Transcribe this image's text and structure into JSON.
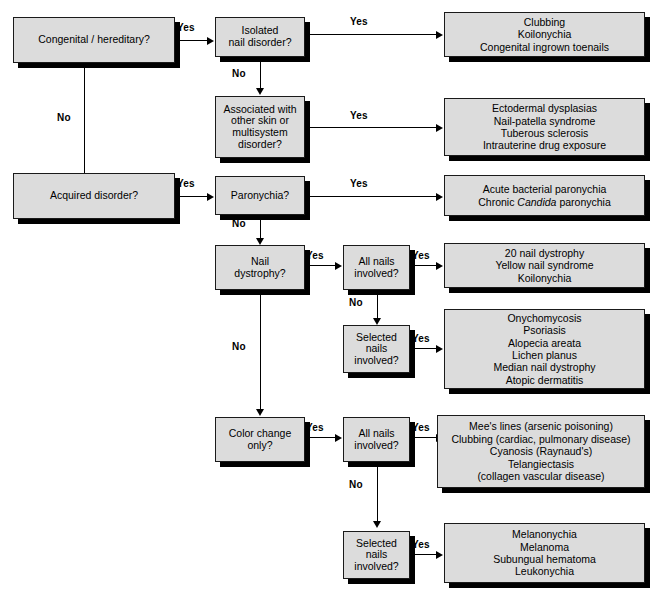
{
  "diagram": {
    "title_cropped": "",
    "edge_labels": {
      "yes": "Yes",
      "no": "No"
    }
  },
  "nodes": {
    "congenital": {
      "type": "decision",
      "lines": [
        "Congenital / hereditary?"
      ]
    },
    "acquired": {
      "type": "decision",
      "lines": [
        "Acquired disorder?"
      ]
    },
    "isolated": {
      "type": "decision",
      "lines": [
        "Isolated",
        "nail disorder?"
      ]
    },
    "associated": {
      "type": "decision",
      "lines": [
        "Associated with",
        "other skin or",
        "multisystem",
        "disorder?"
      ]
    },
    "paronychia": {
      "type": "decision",
      "lines": [
        "Paronychia?"
      ]
    },
    "nail_dystrophy": {
      "type": "decision",
      "lines": [
        "Nail",
        "dystrophy?"
      ]
    },
    "color_change": {
      "type": "decision",
      "lines": [
        "Color change",
        "only?"
      ]
    },
    "all_nails_1": {
      "type": "decision",
      "lines": [
        "All nails",
        "involved?"
      ]
    },
    "selected_nails_1": {
      "type": "decision",
      "lines": [
        "Selected",
        "nails",
        "involved?"
      ]
    },
    "all_nails_2": {
      "type": "decision",
      "lines": [
        "All nails",
        "involved?"
      ]
    },
    "selected_nails_2": {
      "type": "decision",
      "lines": [
        "Selected",
        "nails",
        "involved?"
      ]
    },
    "outcome_isolated": {
      "type": "outcome",
      "lines": [
        "Clubbing",
        "Koilonychia",
        "Congenital ingrown toenails"
      ]
    },
    "outcome_associated": {
      "type": "outcome",
      "lines": [
        "Ectodermal dysplasias",
        "Nail-patella syndrome",
        "Tuberous sclerosis",
        "Intrauterine drug exposure"
      ]
    },
    "outcome_paronychia": {
      "type": "outcome",
      "lines": [
        "Acute bacterial paronychia",
        "Chronic Candida paronychia"
      ]
    },
    "outcome_all_nails_1": {
      "type": "outcome",
      "lines": [
        "20 nail dystrophy",
        "Yellow nail syndrome",
        "Koilonychia"
      ]
    },
    "outcome_selected_nails_1": {
      "type": "outcome",
      "lines": [
        "Onychomycosis",
        "Psoriasis",
        "Alopecia areata",
        "Lichen planus",
        "Median nail dystrophy",
        "Atopic dermatitis"
      ]
    },
    "outcome_all_nails_2": {
      "type": "outcome",
      "lines": [
        "Mee's lines (arsenic poisoning)",
        "Clubbing (cardiac, pulmonary disease)",
        "Cyanosis (Raynaud's)",
        "Telangiectasis",
        "(collagen vascular disease)"
      ]
    },
    "outcome_selected_nails_2": {
      "type": "outcome",
      "lines": [
        "Melanonychia",
        "Melanoma",
        "Subungual hematoma",
        "Leukonychia"
      ]
    }
  },
  "colors": {
    "box_fill": "#dcdcdc",
    "box_border": "#1a1a1a",
    "shadow": "#000000",
    "text": "#000000",
    "background": "#ffffff"
  }
}
